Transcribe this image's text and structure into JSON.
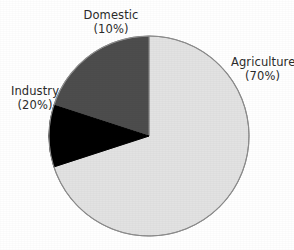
{
  "chart_data": {
    "type": "pie",
    "title": "",
    "categories": [
      "Agriculture",
      "Industry",
      "Domestic"
    ],
    "values": [
      70,
      20,
      10
    ],
    "unit": "%",
    "labels": [
      {
        "name": "Agriculture",
        "percent_text": "(70%)",
        "value": 70,
        "color": "#e2e2e2",
        "position": "right"
      },
      {
        "name": "Industry",
        "percent_text": "(20%)",
        "value": 20,
        "color": "#4d4d4d",
        "position": "left"
      },
      {
        "name": "Domestic",
        "percent_text": "(10%)",
        "value": 10,
        "color": "#000000",
        "position": "top"
      }
    ],
    "legend": "none",
    "start_angle_deg": 0,
    "direction": "counterclockwise",
    "grid": false
  },
  "figure": {
    "background_color": "#ffffff",
    "outline_color": "#8c8c8c",
    "text_color": "#2b2b2b",
    "center_x": 149,
    "center_y": 136,
    "radius": 100
  }
}
